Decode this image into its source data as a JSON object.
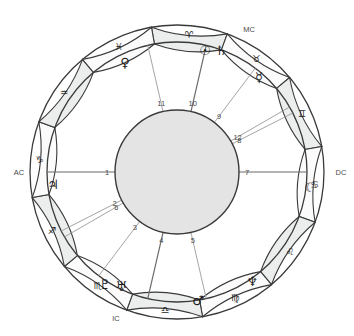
{
  "chart_data": {
    "type": "scatter",
    "xlabel": "",
    "ylabel": "",
    "center": {
      "x": 177,
      "y": 172
    },
    "radii": {
      "outer": 147,
      "ring_inner": 130,
      "hub": 62,
      "house_number": 70,
      "planet": 112,
      "sign_glyph": 138
    },
    "geometry_note": "Angle 0 degrees points left (Ascendant); angles increase counter-clockwise on screen.",
    "signs": [
      {
        "name": "Aries",
        "glyph": "♈",
        "angle_deg": 95,
        "element": "fire"
      },
      {
        "name": "Taurus",
        "glyph": "♉",
        "angle_deg": 125,
        "element": "earth"
      },
      {
        "name": "Gemini",
        "glyph": "♊",
        "angle_deg": 155,
        "element": "air"
      },
      {
        "name": "Cancer",
        "glyph": "♋",
        "angle_deg": 185,
        "element": "water"
      },
      {
        "name": "Leo",
        "glyph": "♌",
        "angle_deg": 215,
        "element": "fire"
      },
      {
        "name": "Virgo",
        "glyph": "♍",
        "angle_deg": 245,
        "element": "earth"
      },
      {
        "name": "Libra",
        "glyph": "♎",
        "angle_deg": 275,
        "element": "air"
      },
      {
        "name": "Scorpio",
        "glyph": "♏",
        "angle_deg": 305,
        "element": "water"
      },
      {
        "name": "Sagittarius",
        "glyph": "♐",
        "angle_deg": 335,
        "element": "fire"
      },
      {
        "name": "Capricorn",
        "glyph": "♑",
        "angle_deg": 5,
        "element": "earth"
      },
      {
        "name": "Aquarius",
        "glyph": "♒",
        "angle_deg": 35,
        "element": "air"
      },
      {
        "name": "Pisces",
        "glyph": "♓",
        "angle_deg": 65,
        "element": "water"
      }
    ],
    "sign_boundaries_deg": [
      80,
      110,
      140,
      170,
      200,
      230,
      260,
      290,
      320,
      350,
      20,
      50
    ],
    "houses": [
      {
        "number": "1",
        "cusp_deg": 0,
        "is_angle": true,
        "angle_name": "AC"
      },
      {
        "number": "2",
        "cusp_deg": 333,
        "is_angle": false,
        "angle_name": ""
      },
      {
        "number": "3",
        "cusp_deg": 307,
        "is_angle": false,
        "angle_name": ""
      },
      {
        "number": "4",
        "cusp_deg": 283,
        "is_angle": true,
        "angle_name": "IC"
      },
      {
        "number": "5",
        "cusp_deg": 257,
        "is_angle": false,
        "angle_name": ""
      },
      {
        "number": "6",
        "cusp_deg": 330,
        "is_angle": false,
        "angle_name": ""
      },
      {
        "number": "7",
        "cusp_deg": 180,
        "is_angle": true,
        "angle_name": "DC"
      },
      {
        "number": "8",
        "cusp_deg": 153,
        "is_angle": false,
        "angle_name": ""
      },
      {
        "number": "9",
        "cusp_deg": 127,
        "is_angle": false,
        "angle_name": ""
      },
      {
        "number": "10",
        "cusp_deg": 103,
        "is_angle": true,
        "angle_name": "MC"
      },
      {
        "number": "11",
        "cusp_deg": 77,
        "is_angle": false,
        "angle_name": ""
      },
      {
        "number": "12",
        "cusp_deg": 150,
        "is_angle": false,
        "angle_name": ""
      }
    ],
    "cusp_lines_deg": [
      0,
      180,
      103,
      283,
      77,
      150,
      153,
      127,
      333,
      307,
      257,
      330
    ],
    "house_numbers": [
      "1",
      "2",
      "3",
      "4",
      "5",
      "6",
      "7",
      "8",
      "9",
      "10",
      "11",
      "12"
    ],
    "angles": [
      {
        "label": "AC",
        "x": 19,
        "y": 172,
        "full_name": "Ascendant"
      },
      {
        "label": "DC",
        "x": 341,
        "y": 172,
        "full_name": "Descendant"
      },
      {
        "label": "MC",
        "x": 249,
        "y": 29,
        "full_name": "Medium Coeli"
      },
      {
        "label": "IC",
        "x": 116,
        "y": 318,
        "full_name": "Imum Coeli"
      }
    ],
    "planets": [
      {
        "name": "Sun",
        "glyph": "☉",
        "x": 205,
        "y": 50
      },
      {
        "name": "Saturn",
        "glyph": "♄",
        "x": 221,
        "y": 50
      },
      {
        "name": "Mercury",
        "glyph": "☿",
        "x": 259,
        "y": 77
      },
      {
        "name": "Venus",
        "glyph": "♀",
        "x": 125,
        "y": 62
      },
      {
        "name": "Jupiter",
        "glyph": "♃",
        "x": 53,
        "y": 184
      },
      {
        "name": "Moon",
        "glyph": "☾",
        "x": 310,
        "y": 187
      },
      {
        "name": "Pluto",
        "glyph": "♇",
        "x": 105,
        "y": 284
      },
      {
        "name": "Uranus",
        "glyph": "♅",
        "x": 121,
        "y": 286
      },
      {
        "name": "Mars",
        "glyph": "♂",
        "x": 198,
        "y": 300
      },
      {
        "name": "Neptune",
        "glyph": "♆",
        "x": 252,
        "y": 281
      }
    ],
    "colors": {
      "ring_fill": "#eceded",
      "ring_fill_alt": "#fbfbfb",
      "hub_fill": "#e4e4e4",
      "stroke": "#3a3a3a",
      "cusp_line": "#9a9a9a",
      "text": "#1d1d1d",
      "background": "#ffffff"
    },
    "grid": false,
    "legend": false
  }
}
